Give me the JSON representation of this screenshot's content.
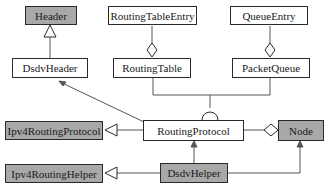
{
  "diagram": {
    "type": "uml-class-diagram",
    "classes": [
      {
        "id": "header",
        "label": "Header",
        "shaded": true
      },
      {
        "id": "routing_table_entry",
        "label": "RoutingTableEntry",
        "shaded": false
      },
      {
        "id": "queue_entry",
        "label": "QueueEntry",
        "shaded": false
      },
      {
        "id": "dsdv_header",
        "label": "DsdvHeader",
        "shaded": false
      },
      {
        "id": "routing_table",
        "label": "RoutingTable",
        "shaded": false
      },
      {
        "id": "packet_queue",
        "label": "PacketQueue",
        "shaded": false
      },
      {
        "id": "ipv4_routing_protocol",
        "label": "Ipv4RoutingProtocol",
        "shaded": true
      },
      {
        "id": "routing_protocol",
        "label": "RoutingProtocol",
        "shaded": false
      },
      {
        "id": "node",
        "label": "Node",
        "shaded": true
      },
      {
        "id": "ipv4_routing_helper",
        "label": "Ipv4RoutingHelper",
        "shaded": true
      },
      {
        "id": "dsdv_helper",
        "label": "DsdvHelper",
        "shaded": true
      }
    ],
    "relations": [
      {
        "from": "DsdvHeader",
        "to": "Header",
        "kind": "generalization"
      },
      {
        "from": "RoutingTable",
        "to": "RoutingTableEntry",
        "kind": "aggregation"
      },
      {
        "from": "PacketQueue",
        "to": "QueueEntry",
        "kind": "aggregation"
      },
      {
        "from": "RoutingProtocol",
        "to": "DsdvHeader",
        "kind": "association"
      },
      {
        "from": "RoutingProtocol",
        "to": "RoutingTable",
        "kind": "required-interface"
      },
      {
        "from": "RoutingProtocol",
        "to": "PacketQueue",
        "kind": "required-interface"
      },
      {
        "from": "RoutingProtocol",
        "to": "Ipv4RoutingProtocol",
        "kind": "generalization"
      },
      {
        "from": "Node",
        "to": "RoutingProtocol",
        "kind": "aggregation"
      },
      {
        "from": "DsdvHelper",
        "to": "Ipv4RoutingHelper",
        "kind": "generalization"
      },
      {
        "from": "DsdvHelper",
        "to": "RoutingProtocol",
        "kind": "association"
      },
      {
        "from": "DsdvHelper",
        "to": "Node",
        "kind": "association"
      }
    ]
  },
  "colors": {
    "shaded_fill": "#a8a8a8",
    "plain_fill": "#ffffff",
    "line": "#555555",
    "border": "#2a2a2a"
  }
}
